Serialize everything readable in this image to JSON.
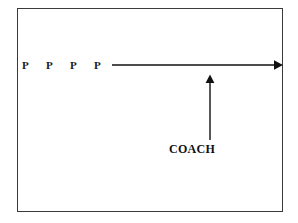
{
  "diagram": {
    "background_color": "#ffffff",
    "border_color": "#3a3a3a",
    "stroke_color": "#111111",
    "field": {
      "shape": "rectangle",
      "x": 17,
      "y": 8,
      "width": 266,
      "height": 204
    },
    "players": [
      {
        "label": "P",
        "x": 22,
        "y": 60
      },
      {
        "label": "P",
        "x": 46,
        "y": 60
      },
      {
        "label": "P",
        "x": 70,
        "y": 60
      },
      {
        "label": "P",
        "x": 94,
        "y": 60
      }
    ],
    "coach": {
      "label": "COACH",
      "x": 169,
      "y": 143
    },
    "arrows": [
      {
        "name": "players-direction-arrow",
        "orientation": "horizontal",
        "direction": "right",
        "x1": 112,
        "y1": 65,
        "x2": 281,
        "y2": 65
      },
      {
        "name": "coach-pointer-arrow",
        "orientation": "vertical",
        "direction": "up",
        "x1": 210,
        "y1": 140,
        "x2": 210,
        "y2": 76
      }
    ]
  }
}
